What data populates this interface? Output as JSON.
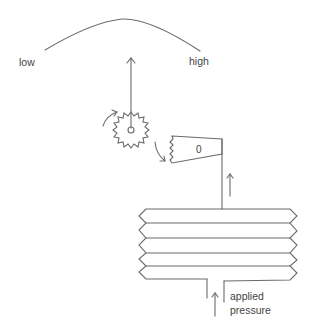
{
  "diagram": {
    "scale": {
      "low_label": "low",
      "high_label": "high"
    },
    "rack": {
      "value_label": "0"
    },
    "inlet": {
      "label_line1": "applied",
      "label_line2": "pressure"
    },
    "bellows": {
      "convolutions": 5
    },
    "colors": {
      "line": "#6b6b6b",
      "text": "#444444",
      "background": "#ffffff"
    }
  }
}
